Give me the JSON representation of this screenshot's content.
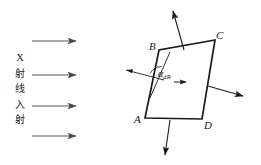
{
  "figure": {
    "caption_text_vertical": [
      "X",
      "射",
      "线",
      "入",
      "射"
    ],
    "vertices": {
      "A": "A",
      "B": "B",
      "C": "C",
      "D": "D"
    },
    "angle": {
      "symbol": "α",
      "subscript": "dR"
    },
    "colors": {
      "line": "#1a1a1a",
      "incident_ray": "#6b6b6b",
      "background": "#ffffff"
    },
    "geometry": {
      "quad_points": "145,118 159,50 215,40 202,119",
      "incident_arrows": [
        {
          "x1": 32,
          "y1": 41,
          "x2": 78,
          "y2": 41
        },
        {
          "x1": 32,
          "y1": 75,
          "x2": 78,
          "y2": 75
        },
        {
          "x1": 32,
          "y1": 106,
          "x2": 78,
          "y2": 106
        },
        {
          "x1": 32,
          "y1": 136,
          "x2": 78,
          "y2": 136
        }
      ],
      "diffracted_arrows": [
        {
          "name": "up",
          "x1": 183,
          "y1": 48,
          "x2": 172,
          "y2": 9
        },
        {
          "name": "right",
          "x1": 208,
          "y1": 86,
          "x2": 246,
          "y2": 97
        },
        {
          "name": "down",
          "x1": 170,
          "y1": 120,
          "x2": 164,
          "y2": 158
        },
        {
          "name": "inner-right",
          "x1": 173,
          "y1": 82,
          "x2": 189,
          "y2": 82
        }
      ],
      "ray_into_crystal": {
        "x1": 128,
        "y1": 71,
        "x2": 163,
        "y2": 80
      },
      "normal_line": {
        "x1": 168,
        "y1": 55,
        "x2": 151,
        "y2": 95
      }
    }
  }
}
